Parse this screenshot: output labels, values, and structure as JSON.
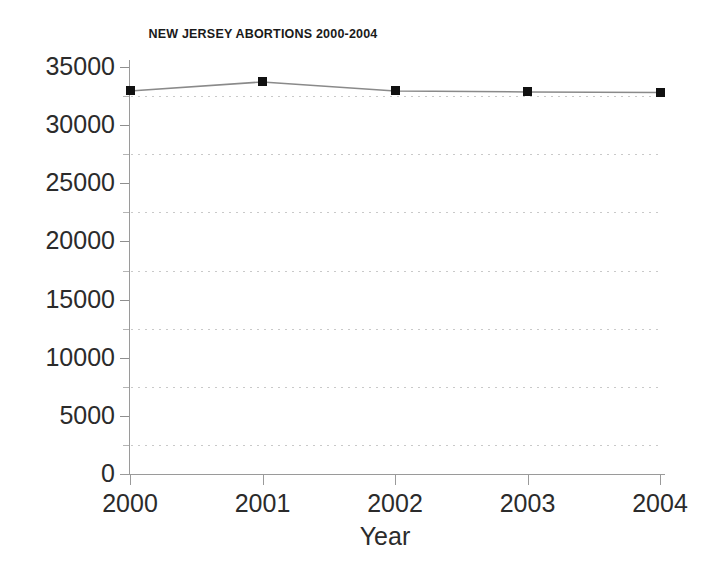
{
  "chart_data": {
    "type": "line",
    "title": "NEW JERSEY ABORTIONS 2000-2004",
    "xlabel": "Year",
    "ylabel": "",
    "categories": [
      "2000",
      "2001",
      "2002",
      "2003",
      "2004"
    ],
    "values": [
      32940,
      33715,
      32940,
      32855,
      32810
    ],
    "series": [
      {
        "name": "New Jersey abortions",
        "values": [
          32940,
          33715,
          32940,
          32855,
          32810
        ],
        "marker": "square",
        "marker_color": "#111111",
        "line_color": "#8a8a8a"
      }
    ],
    "xlim": [
      2000,
      2004
    ],
    "ylim": [
      0,
      35000
    ],
    "ytick_labels": [
      "35000",
      "30000",
      "25000",
      "20000",
      "15000",
      "10000",
      "5000",
      "0"
    ],
    "ytick_values": [
      35000,
      30000,
      25000,
      20000,
      15000,
      10000,
      5000,
      0
    ],
    "ytick_interval": 5000,
    "minor_gridline_values": [
      32500,
      27500,
      22500,
      17500,
      12500,
      7500,
      2500
    ],
    "grid": "horizontal-dotted-minor",
    "legend": "none",
    "legend_position": "none",
    "background_color": "#ffffff",
    "axis_color": "#9a9a9a",
    "gridline_color": "#c9c9c9",
    "text_color": "#2b2b2b"
  },
  "chart": {
    "title": "NEW JERSEY ABORTIONS 2000-2004",
    "x_axis_title": "Year",
    "y_tick_labels": [
      "35000",
      "30000",
      "25000",
      "20000",
      "15000",
      "10000",
      "5000",
      "0"
    ],
    "x_tick_labels": [
      "2000",
      "2001",
      "2002",
      "2003",
      "2004"
    ]
  }
}
